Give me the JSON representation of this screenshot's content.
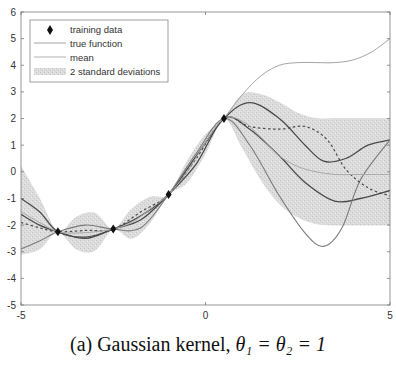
{
  "caption": {
    "label": "(a)",
    "text": "Gaussian kernel,",
    "math": "θ₁ = θ₂ = 1"
  },
  "chart_data": {
    "type": "line",
    "title": "",
    "xlabel": "",
    "ylabel": "",
    "xlim": [
      -5,
      5
    ],
    "ylim": [
      -5,
      6
    ],
    "xticks": [
      -5,
      0,
      5
    ],
    "yticks": [
      -5,
      -4,
      -3,
      -2,
      -1,
      0,
      1,
      2,
      3,
      4,
      5,
      6
    ],
    "grid": false,
    "legend": {
      "position": "upper left",
      "entries": [
        "training data",
        "true function",
        "mean",
        "2 standard deviations"
      ]
    },
    "training_data": {
      "x": [
        -4.0,
        -2.5,
        -1.0,
        0.5
      ],
      "y": [
        -2.25,
        -2.15,
        -0.85,
        2.0
      ]
    },
    "true_function": {
      "x": [
        0.5,
        1.0,
        1.5,
        2.0,
        2.5,
        3.0,
        3.5,
        4.0,
        4.5,
        5.0
      ],
      "y": [
        2.0,
        2.9,
        3.6,
        4.0,
        4.1,
        4.1,
        4.1,
        4.2,
        4.5,
        5.0
      ]
    },
    "mean": {
      "x": [
        -5,
        -4.5,
        -4,
        -3.5,
        -3,
        -2.5,
        -2,
        -1.5,
        -1,
        -0.5,
        0,
        0.5,
        1,
        1.5,
        2,
        2.5,
        3,
        3.5,
        4,
        4.5,
        5
      ],
      "y": [
        -1.5,
        -1.9,
        -2.25,
        -2.3,
        -2.25,
        -2.15,
        -1.9,
        -1.4,
        -0.85,
        0.0,
        1.1,
        2.0,
        1.9,
        1.3,
        0.6,
        0.2,
        0.0,
        -0.1,
        -0.1,
        -0.1,
        -0.1
      ]
    },
    "band_2std": {
      "x": [
        -5,
        -4.5,
        -4,
        -3.5,
        -3,
        -2.5,
        -2,
        -1.5,
        -1,
        -0.5,
        0,
        0.5,
        1,
        1.5,
        2,
        2.5,
        3,
        3.5,
        4,
        4.5,
        5
      ],
      "upper": [
        0.2,
        -1.0,
        -2.25,
        -1.7,
        -1.55,
        -2.15,
        -1.4,
        -0.95,
        -0.85,
        0.4,
        1.4,
        2.0,
        2.9,
        2.9,
        2.6,
        2.2,
        2.0,
        2.0,
        2.0,
        2.0,
        2.0
      ],
      "lower": [
        -3.1,
        -2.9,
        -2.25,
        -2.9,
        -2.95,
        -2.15,
        -2.5,
        -1.9,
        -0.85,
        -0.4,
        0.7,
        2.0,
        0.9,
        -0.3,
        -1.2,
        -1.7,
        -1.95,
        -2.0,
        -2.0,
        -2.0,
        -2.0
      ]
    },
    "samples": [
      {
        "name": "sample 1",
        "style": "solid-dark",
        "x": [
          -5,
          -4.5,
          -4,
          -3.25,
          -2.5,
          -1.75,
          -1,
          -0.25,
          0.5,
          1.2,
          2,
          2.7,
          3.2,
          3.8,
          4.4,
          5
        ],
        "y": [
          -1.0,
          -1.5,
          -2.25,
          -2.45,
          -2.15,
          -1.65,
          -0.85,
          0.6,
          2.0,
          2.6,
          2.0,
          1.0,
          0.4,
          0.5,
          1.0,
          1.2
        ]
      },
      {
        "name": "sample 2",
        "style": "solid-dark",
        "x": [
          -5,
          -4.5,
          -4,
          -3.25,
          -2.5,
          -1.75,
          -1,
          -0.25,
          0.5,
          1.2,
          2,
          2.7,
          3.5,
          4.2,
          5
        ],
        "y": [
          -1.6,
          -2.0,
          -2.25,
          -2.5,
          -2.15,
          -1.8,
          -0.85,
          0.3,
          2.0,
          1.6,
          0.6,
          -0.4,
          -1.1,
          -1.0,
          -0.7
        ]
      },
      {
        "name": "sample 3",
        "style": "solid-gray",
        "x": [
          -5,
          -4.5,
          -4,
          -3.25,
          -2.5,
          -1.75,
          -1,
          -0.25,
          0.5,
          1.2,
          2,
          2.7,
          3.2,
          3.7,
          4.2,
          5
        ],
        "y": [
          -2.9,
          -2.6,
          -2.25,
          -2.0,
          -2.15,
          -2.1,
          -0.85,
          0.7,
          2.0,
          1.0,
          -0.9,
          -2.3,
          -2.8,
          -2.1,
          -0.3,
          1.2
        ]
      },
      {
        "name": "sample 4",
        "style": "dashed",
        "x": [
          -5,
          -4.5,
          -4,
          -3.25,
          -2.5,
          -1.75,
          -1,
          -0.25,
          0.5,
          1.2,
          2,
          2.7,
          3.3,
          3.8,
          4.4,
          5
        ],
        "y": [
          -1.9,
          -2.1,
          -2.25,
          -2.2,
          -2.15,
          -1.5,
          -0.85,
          0.5,
          2.0,
          1.7,
          1.6,
          1.7,
          1.2,
          0.1,
          -0.6,
          -0.9
        ]
      }
    ]
  },
  "plot_area": {
    "left_px": 21,
    "right_px": 390,
    "top_px": 12,
    "bottom_px": 305
  },
  "colors": {
    "axis": "#555555",
    "band": "#d4d4d4",
    "true_function": "#9a9a9a",
    "mean": "#a8a8a8",
    "sample_dark": "#4a4a4a",
    "sample_gray": "#7a7a7a",
    "training_marker": "#111111"
  }
}
